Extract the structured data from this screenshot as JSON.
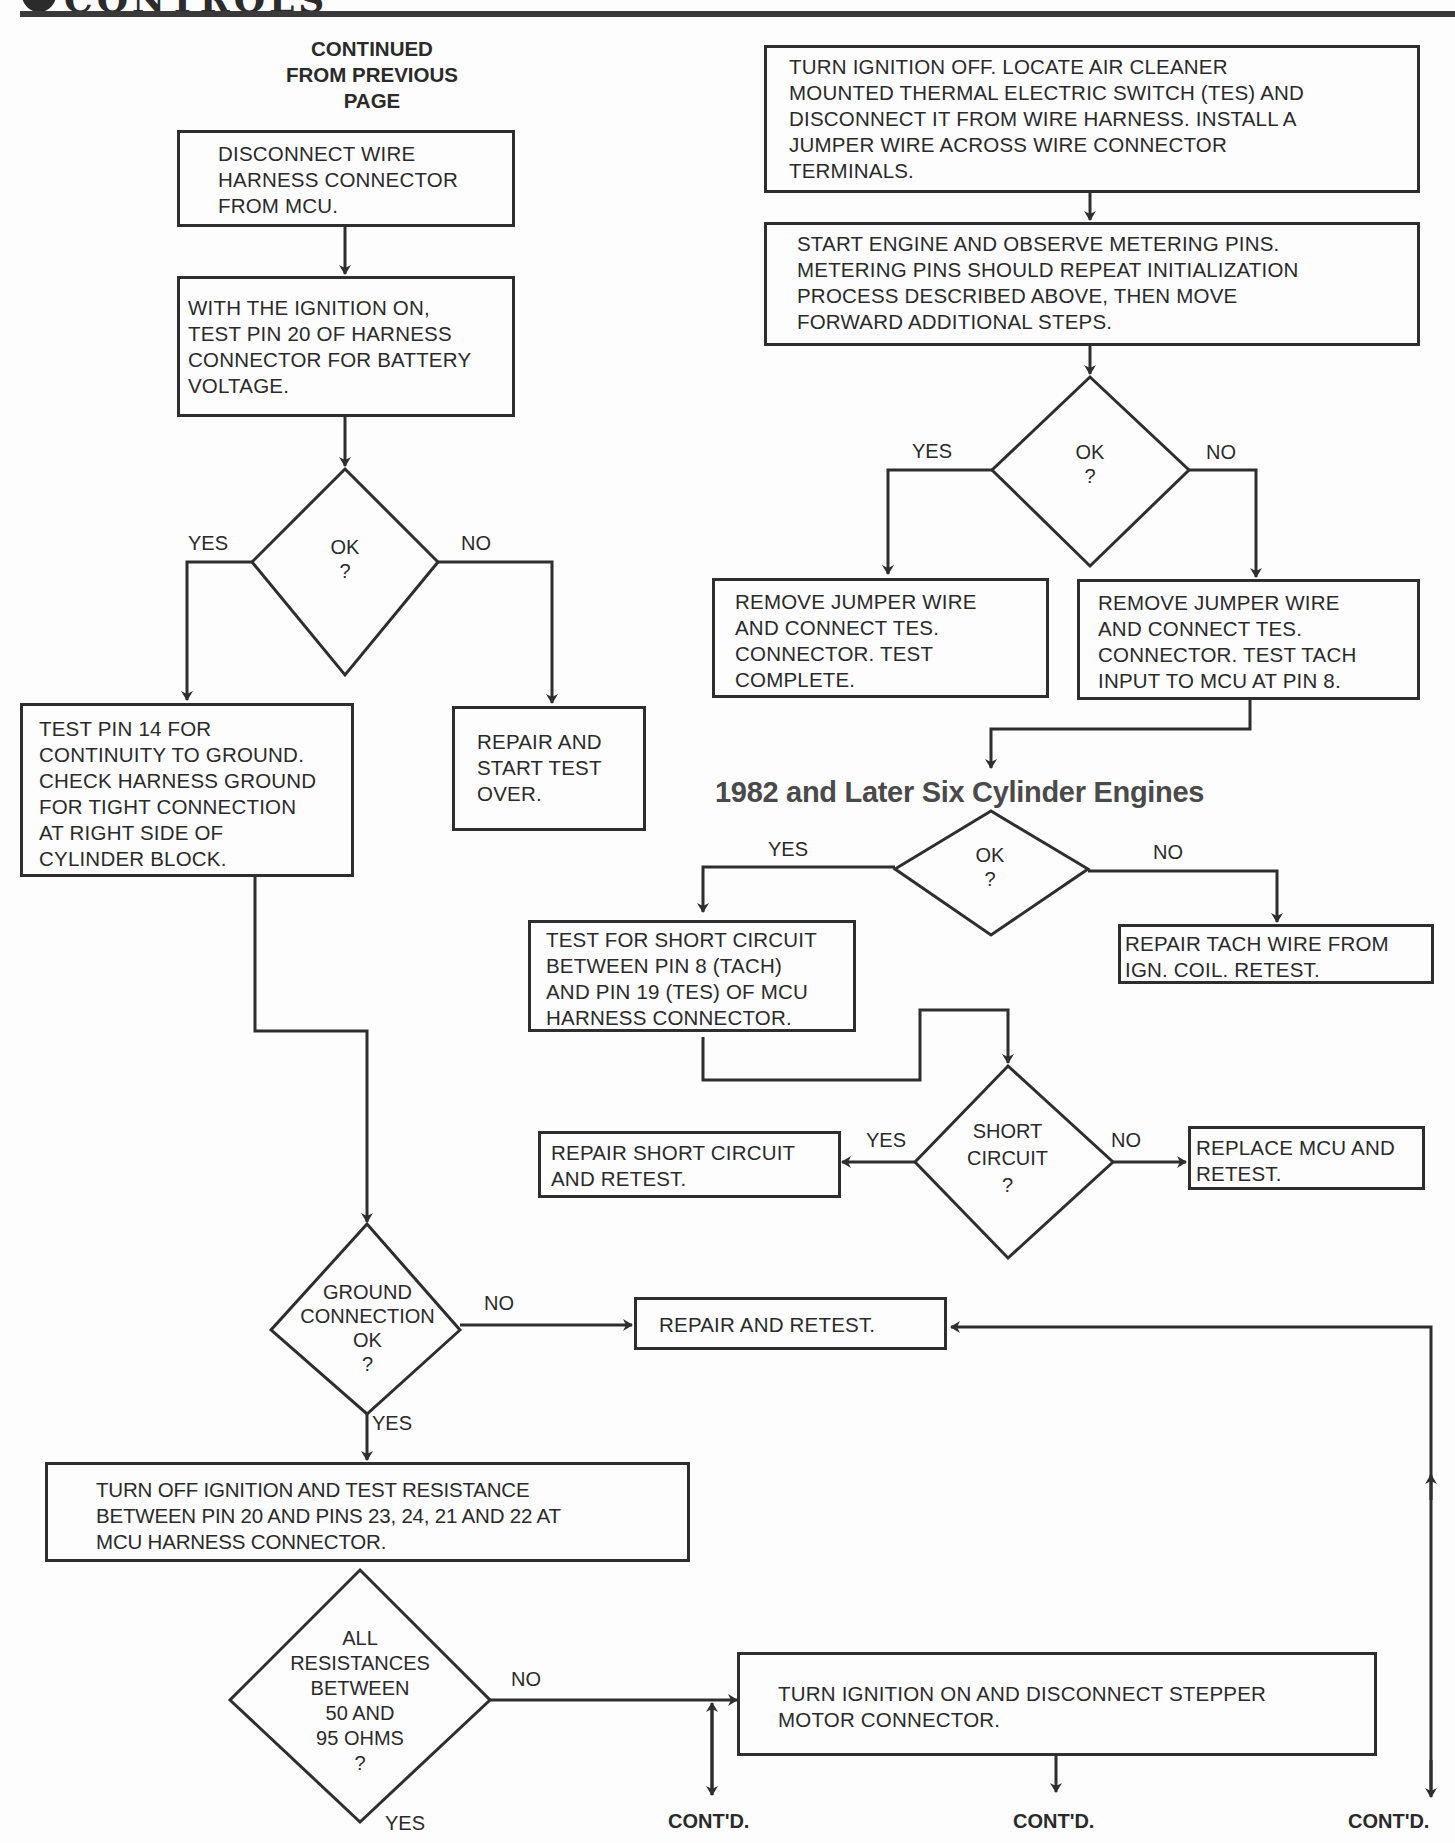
{
  "header": {
    "title": "CONTROLS",
    "side_letter": "S"
  },
  "continued_from": "CONTINUED\nFROM PREVIOUS\nPAGE",
  "section_heading": "1982 and Later Six Cylinder Engines",
  "labels": {
    "yes": "YES",
    "no": "NO",
    "contd": "CONT'D."
  },
  "left_flow": {
    "step1": "DISCONNECT WIRE\nHARNESS CONNECTOR\nFROM MCU.",
    "step2": "WITH THE IGNITION ON,\nTEST PIN 20 OF HARNESS\nCONNECTOR FOR BATTERY\nVOLTAGE.",
    "decision1": "OK\n?",
    "yes_box": "TEST PIN 14 FOR\nCONTINUITY TO GROUND.\nCHECK HARNESS GROUND\nFOR TIGHT CONNECTION\nAT RIGHT SIDE OF\nCYLINDER BLOCK.",
    "no_box": "REPAIR AND\nSTART TEST\nOVER.",
    "decision2": "GROUND\nCONNECTION\nOK\n?",
    "decision2_no_box": "REPAIR AND RETEST.",
    "step3": "TURN OFF IGNITION AND TEST RESISTANCE\nBETWEEN PIN 20 AND PINS 23, 24, 21 AND 22 AT\nMCU HARNESS CONNECTOR.",
    "decision3": "ALL\nRESISTANCES\nBETWEEN\n50 AND\n95 OHMS\n?",
    "decision3_no_box": "TURN IGNITION ON AND DISCONNECT STEPPER\nMOTOR CONNECTOR."
  },
  "right_flow": {
    "step1": "TURN IGNITION OFF. LOCATE AIR CLEANER\nMOUNTED THERMAL ELECTRIC SWITCH (TES) AND\nDISCONNECT IT FROM WIRE HARNESS. INSTALL A\nJUMPER WIRE ACROSS WIRE CONNECTOR\nTERMINALS.",
    "step2": "START ENGINE AND OBSERVE METERING PINS.\nMETERING PINS SHOULD REPEAT INITIALIZATION\nPROCESS DESCRIBED ABOVE, THEN MOVE\nFORWARD ADDITIONAL STEPS.",
    "decision1": "OK\n?",
    "yes_box": "REMOVE JUMPER WIRE\nAND CONNECT TES.\nCONNECTOR. TEST\nCOMPLETE.",
    "no_box": "REMOVE JUMPER WIRE\nAND CONNECT TES.\nCONNECTOR. TEST TACH\nINPUT TO MCU AT PIN 8.",
    "decision2": "OK\n?",
    "d2_yes_box": "TEST FOR SHORT CIRCUIT\nBETWEEN PIN 8 (TACH)\nAND PIN 19 (TES) OF MCU\nHARNESS CONNECTOR.",
    "d2_no_box": "REPAIR TACH WIRE FROM\nIGN. COIL. RETEST.",
    "decision3": "SHORT\nCIRCUIT\n?",
    "d3_yes_box": "REPAIR SHORT CIRCUIT\nAND RETEST.",
    "d3_no_box": "REPLACE MCU AND\nRETEST."
  }
}
